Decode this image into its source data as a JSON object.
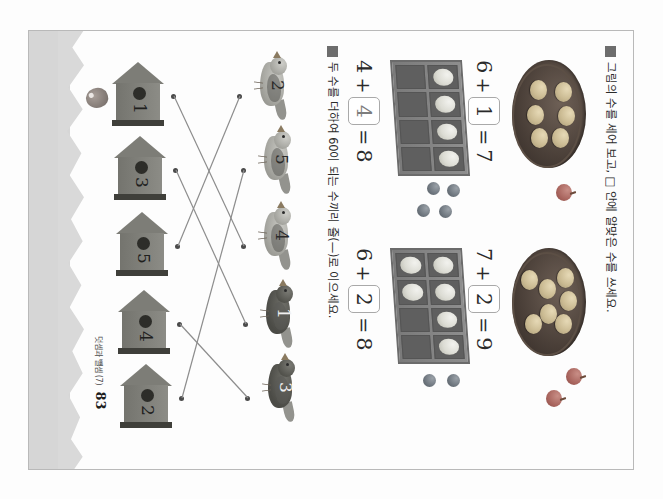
{
  "document": {
    "kind": "scanned-worksheet-page",
    "language": "ko",
    "orientation": "rotated-90-ccw",
    "page_number": "83",
    "footer_chapter": "덧셈과 뺄셈 (7)"
  },
  "problems": [
    {
      "id": "problem-1",
      "bullet": "square-bullet",
      "instruction": "그림의 수를 세어 보고, □ 안에 알맞은 수를 쓰세요.",
      "items": [
        {
          "id": "item-1-1",
          "illustration": "muffin-pan",
          "muffin_count": 6,
          "loose_count": 1,
          "loose_kind": "apple",
          "equation": {
            "a": "6",
            "op": "+",
            "b": "1",
            "eq": "=",
            "result": "7"
          },
          "answer_in_box": "1",
          "answer_style": "ink"
        },
        {
          "id": "item-1-2",
          "illustration": "muffin-pan",
          "muffin_count": 7,
          "loose_count": 2,
          "loose_kind": "apple",
          "equation": {
            "a": "7",
            "op": "+",
            "b": "2",
            "eq": "=",
            "result": "9"
          },
          "answer_in_box": "2",
          "answer_style": "ink"
        },
        {
          "id": "item-1-3",
          "illustration": "egg-carton",
          "filled_cells": 4,
          "total_cells": 8,
          "loose_count": 4,
          "loose_kind": "berry",
          "equation": {
            "a": "4",
            "op": "+",
            "b": "4",
            "eq": "=",
            "result": "8"
          },
          "answer_in_box": "4",
          "answer_style": "pencil"
        },
        {
          "id": "item-1-4",
          "illustration": "egg-carton",
          "filled_cells": 6,
          "total_cells": 8,
          "loose_count": 2,
          "loose_kind": "berry",
          "equation": {
            "a": "6",
            "op": "+",
            "b": "2",
            "eq": "=",
            "result": "8"
          },
          "answer_in_box": "2",
          "answer_style": "ink"
        }
      ]
    },
    {
      "id": "problem-2",
      "bullet": "square-bullet",
      "instruction": "두 수를 더하여 60이 되는 수끼리 줄(—)로 이으세요.",
      "target_sum": "60",
      "birds": [
        {
          "id": "bird-1",
          "label": "2",
          "shade": "light"
        },
        {
          "id": "bird-2",
          "label": "5",
          "shade": "light"
        },
        {
          "id": "bird-3",
          "label": "4",
          "shade": "light"
        },
        {
          "id": "bird-4",
          "label": "1",
          "shade": "dark"
        },
        {
          "id": "bird-5",
          "label": "3",
          "shade": "dark"
        }
      ],
      "houses": [
        {
          "id": "house-1",
          "label": "1"
        },
        {
          "id": "house-2",
          "label": "3"
        },
        {
          "id": "house-3",
          "label": "5"
        },
        {
          "id": "house-4",
          "label": "4"
        },
        {
          "id": "house-5",
          "label": "2"
        }
      ],
      "connections": [
        {
          "from": "bird-1",
          "to": "house-3"
        },
        {
          "from": "bird-2",
          "to": "house-5"
        },
        {
          "from": "bird-3",
          "to": "house-1"
        },
        {
          "from": "bird-4",
          "to": "house-2"
        },
        {
          "from": "bird-5",
          "to": "house-4"
        }
      ]
    }
  ],
  "colors": {
    "paper": "#fdfdfd",
    "margin_strip": "#d6d6d6",
    "ink": "#2a2a2a",
    "pencil": "#7d7d7d",
    "box_border": "#a9a9a9",
    "house_fill": "#7d7d77"
  }
}
